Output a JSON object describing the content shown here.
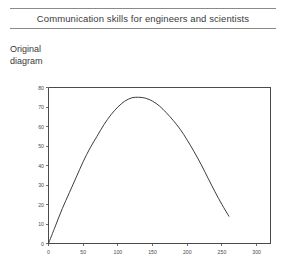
{
  "header": {
    "title": "Communication skills for engineers and scientists"
  },
  "caption": {
    "line1": "Original",
    "line2": "diagram"
  },
  "chart_data": {
    "type": "line",
    "title": "",
    "xlabel": "",
    "ylabel": "",
    "xlim": [
      0,
      320
    ],
    "ylim": [
      0,
      80
    ],
    "grid": false,
    "legend": null,
    "x_ticks": [
      0,
      50,
      100,
      150,
      200,
      250,
      300
    ],
    "x_tick_labels": [
      "0",
      "50",
      "100",
      "150",
      "200",
      "250",
      "300"
    ],
    "y_ticks": [
      0,
      10,
      20,
      30,
      40,
      50,
      60,
      70,
      80
    ],
    "y_tick_labels": [
      "0",
      "10",
      "20",
      "30",
      "40",
      "50",
      "60",
      "70",
      "80"
    ],
    "series": [
      {
        "name": "curve",
        "color": "#3c3c3c",
        "x": [
          0,
          10,
          20,
          30,
          40,
          50,
          60,
          70,
          80,
          90,
          100,
          110,
          120,
          130,
          140,
          150,
          160,
          170,
          180,
          190,
          200,
          210,
          220,
          230,
          240,
          250,
          260
        ],
        "y": [
          0,
          9,
          18,
          26,
          34,
          42,
          49,
          55,
          61,
          66,
          70,
          73,
          74.7,
          75,
          74.5,
          73,
          70.5,
          67,
          63,
          58.5,
          53,
          47,
          40.5,
          33.5,
          26.5,
          20,
          14
        ]
      }
    ]
  }
}
